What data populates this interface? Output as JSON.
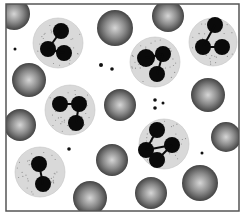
{
  "figure": {
    "colors": {
      "background": "#ffffff",
      "frame": "#555555",
      "rbc_light": "#d8d8d8",
      "rbc_dark": "#4a4a4a",
      "neutrophil_cytoplasm": "#d9d9d9",
      "nucleus": "#0a0a0a",
      "granule": "#8a8a8a"
    },
    "frame": {
      "x": 6,
      "y": 4,
      "w": 233,
      "h": 207
    },
    "red_blood_cells": [
      {
        "cx": 14,
        "cy": 14,
        "r": 16
      },
      {
        "cx": 115,
        "cy": 28,
        "r": 18
      },
      {
        "cx": 168,
        "cy": 16,
        "r": 16
      },
      {
        "cx": 29,
        "cy": 80,
        "r": 17
      },
      {
        "cx": 208,
        "cy": 95,
        "r": 17
      },
      {
        "cx": 120,
        "cy": 105,
        "r": 16
      },
      {
        "cx": 20,
        "cy": 125,
        "r": 16
      },
      {
        "cx": 226,
        "cy": 137,
        "r": 15
      },
      {
        "cx": 112,
        "cy": 160,
        "r": 16
      },
      {
        "cx": 200,
        "cy": 183,
        "r": 18
      },
      {
        "cx": 151,
        "cy": 193,
        "r": 16
      },
      {
        "cx": 90,
        "cy": 198,
        "r": 17
      }
    ],
    "neutrophils": [
      {
        "cx": 58,
        "cy": 43,
        "r": 25,
        "lobes": [
          [
            61,
            31,
            8
          ],
          [
            48,
            49,
            8
          ],
          [
            64,
            53,
            8
          ]
        ]
      },
      {
        "cx": 213,
        "cy": 42,
        "r": 24,
        "lobes": [
          [
            215,
            25,
            8
          ],
          [
            203,
            47,
            8
          ],
          [
            222,
            47,
            8
          ]
        ]
      },
      {
        "cx": 155,
        "cy": 62,
        "r": 25,
        "lobes": [
          [
            146,
            58,
            9
          ],
          [
            163,
            54,
            8
          ],
          [
            157,
            74,
            8
          ]
        ]
      },
      {
        "cx": 70,
        "cy": 110,
        "r": 25,
        "lobes": [
          [
            60,
            104,
            8
          ],
          [
            79,
            104,
            8
          ],
          [
            76,
            123,
            8
          ]
        ]
      },
      {
        "cx": 164,
        "cy": 144,
        "r": 25,
        "lobes": [
          [
            157,
            130,
            8
          ],
          [
            146,
            150,
            8
          ],
          [
            172,
            145,
            8
          ],
          [
            157,
            160,
            8
          ]
        ]
      },
      {
        "cx": 40,
        "cy": 172,
        "r": 25,
        "lobes": [
          [
            39,
            164,
            8
          ],
          [
            43,
            184,
            8
          ]
        ]
      }
    ],
    "platelets": [
      {
        "cx": 15,
        "cy": 49,
        "r": 1.5
      },
      {
        "cx": 101,
        "cy": 65,
        "r": 2
      },
      {
        "cx": 112,
        "cy": 69,
        "r": 1.8
      },
      {
        "cx": 155,
        "cy": 100,
        "r": 1.8
      },
      {
        "cx": 163,
        "cy": 103,
        "r": 1.5
      },
      {
        "cx": 155,
        "cy": 108,
        "r": 1.8
      },
      {
        "cx": 69,
        "cy": 149,
        "r": 1.8
      },
      {
        "cx": 202,
        "cy": 153,
        "r": 1.5
      }
    ]
  }
}
